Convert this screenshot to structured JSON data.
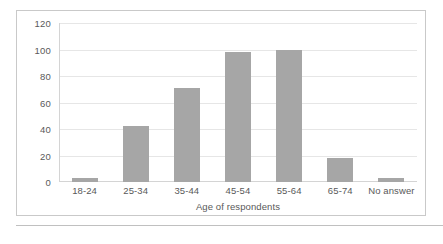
{
  "chart_data": {
    "type": "bar",
    "title": "",
    "xlabel": "Age of respondents",
    "ylabel": "",
    "categories": [
      "18-24",
      "25-34",
      "35-44",
      "45-54",
      "55-64",
      "65-74",
      "No answer"
    ],
    "values": [
      3,
      42,
      71,
      98,
      100,
      18,
      3
    ],
    "ylim": [
      0,
      120
    ],
    "yticks": [
      0,
      20,
      40,
      60,
      80,
      100,
      120
    ],
    "ytick_labels": [
      "0",
      "20",
      "40",
      "60",
      "80",
      "100",
      "120"
    ],
    "grid": true,
    "legend": false,
    "legend_position": "none",
    "series": [
      {
        "name": "Respondents",
        "values": [
          3,
          42,
          71,
          98,
          100,
          18,
          3
        ]
      }
    ]
  },
  "style": {
    "bar_color": "#a6a6a6",
    "text_color": "#595959",
    "gridline_color": "#e6e6e6",
    "axis_color": "#d4d4d4",
    "frame_color": "#c9c9c9",
    "background": "#ffffff"
  }
}
